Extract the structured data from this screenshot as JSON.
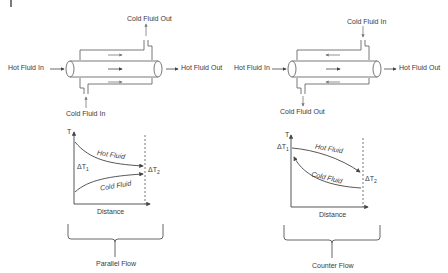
{
  "left_panel": {
    "title": "Parallel Flow",
    "exchanger": {
      "hot_in": "Hot Fluid In",
      "hot_out": "Hot Fluid Out",
      "cold_top": "Cold Fluid Out",
      "cold_bottom": "Cold Fluid In",
      "shell_flow_direction": "right",
      "tube_flow_direction": "right"
    },
    "graph": {
      "y_axis": "T",
      "x_axis": "Distance",
      "hot_curve": "Hot Fluid",
      "cold_curve": "Cold Fluid",
      "delta_t1": "ΔT",
      "delta_t1_sub": "1",
      "delta_t2": "ΔT",
      "delta_t2_sub": "2"
    }
  },
  "right_panel": {
    "title": "Counter Flow",
    "exchanger": {
      "hot_in": "Hot Fluid In",
      "hot_out": "Hot Fluid Out",
      "cold_top": "Cold Fluid In",
      "cold_bottom": "Cold Fluid Out",
      "shell_flow_direction": "left",
      "tube_flow_direction": "right"
    },
    "graph": {
      "y_axis": "T",
      "x_axis": "Distance",
      "hot_curve": "Hot Fluid",
      "cold_curve": "Cold Fluid",
      "delta_t1": "ΔT",
      "delta_t1_sub": "1",
      "delta_t2": "ΔT",
      "delta_t2_sub": "2"
    }
  }
}
